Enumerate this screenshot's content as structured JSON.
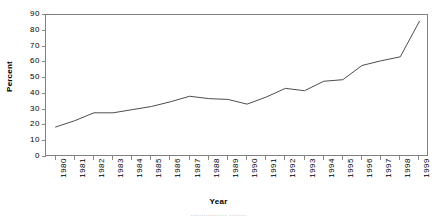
{
  "chart_data": {
    "type": "line",
    "title": "",
    "xlabel": "Year",
    "ylabel": "Percent",
    "categories": [
      "1980",
      "1981",
      "1982",
      "1983",
      "1984",
      "1985",
      "1986",
      "1987",
      "1988",
      "1989",
      "1990",
      "1991",
      "1992",
      "1993",
      "1994",
      "1995",
      "1996",
      "1997",
      "1998",
      "1999"
    ],
    "values": [
      19,
      23,
      28,
      28,
      30,
      32,
      35,
      38.5,
      37,
      36.5,
      33.5,
      38,
      43.5,
      42,
      48,
      49,
      58,
      61,
      63.5,
      86
    ],
    "series": [
      {
        "name": "Percent",
        "values": [
          19,
          23,
          28,
          28,
          30,
          32,
          35,
          38.5,
          37,
          36.5,
          33.5,
          38,
          43.5,
          42,
          48,
          49,
          58,
          61,
          63.5,
          86
        ]
      }
    ],
    "ylim": [
      0,
      90
    ],
    "y_ticks": [
      0,
      10,
      20,
      30,
      40,
      50,
      60,
      70,
      80,
      90
    ],
    "y_tick_labels": [
      "0",
      "10",
      "20",
      "30",
      "40",
      "50",
      "60",
      "70",
      "80",
      "90"
    ],
    "x_tick_labels": [
      "1980",
      "1981",
      "1982",
      "1983",
      "1984",
      "1985",
      "1986",
      "1987",
      "1988",
      "1989",
      "1990",
      "1991",
      "1992",
      "1993",
      "1994",
      "1995",
      "1996",
      "1997",
      "1998",
      "1999"
    ],
    "grid": false,
    "legend": false,
    "legend_position": "none",
    "line_color": "#4d4d4d",
    "frame_color": "#808080",
    "background_color": "#ffffff",
    "x_label_rotation": -90
  },
  "axes": {
    "y_title": "Percent",
    "x_title": "Year"
  },
  "caption": {
    "clipped_text": "................. ........"
  }
}
